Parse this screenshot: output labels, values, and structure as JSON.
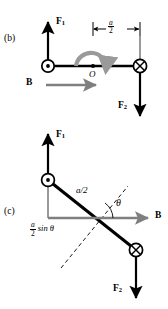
{
  "figure": {
    "background": "#ffffff",
    "ink": "#000000",
    "field_arrow_color": "#7f7f7f",
    "torque_arrow_color": "#9a9a9a"
  },
  "panels": [
    {
      "id": "b",
      "label": "(b)",
      "description": "Bar perpendicular to B; forces F1 up and F2 down produce a torque about O",
      "labels": {
        "force_up": "F",
        "force_up_sub": "1",
        "force_down": "F",
        "force_down_sub": "2",
        "field": "B",
        "pivot": "O",
        "dimension_num": "a",
        "dimension_den": "2"
      },
      "symbols": {
        "current_out_of_page": "circle-dot",
        "current_into_page": "circle-cross"
      }
    },
    {
      "id": "c",
      "label": "(c)",
      "description": "Bar tilted by angle theta to B; moment arm is (a/2) sin theta",
      "labels": {
        "force_up": "F",
        "force_up_sub": "1",
        "force_down": "F",
        "force_down_sub": "2",
        "field": "B",
        "arm_length": "a/2",
        "angle": "θ",
        "moment_arm_num": "a",
        "moment_arm_den": "2",
        "moment_arm_rest": "sin θ"
      },
      "symbols": {
        "current_out_of_page": "circle-dot",
        "current_into_page": "circle-cross"
      }
    }
  ]
}
